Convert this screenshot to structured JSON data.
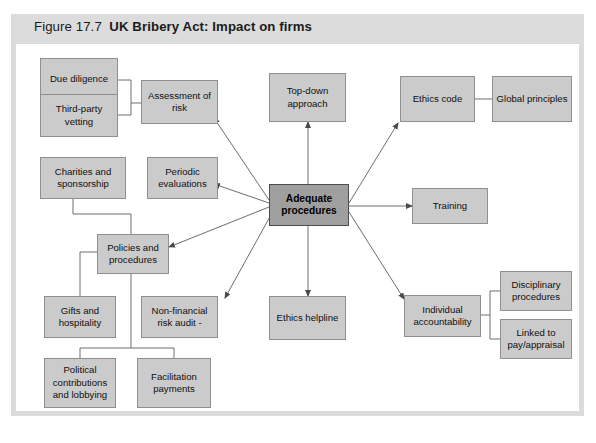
{
  "figure": {
    "number": "Figure 17.7",
    "title": "UK Bribery Act: Impact on firms",
    "full_title": "Figure 17.7  UK Bribery Act: Impact on firms"
  },
  "colors": {
    "frame": "#dcdcdc",
    "node_fill": "#cbcbcb",
    "node_border": "#8f8f8f",
    "center_fill": "#9f9f9f",
    "center_border": "#4d4d4d",
    "connector": "#6e6e6e",
    "page_background": "#ffffff"
  },
  "nodes": {
    "center": {
      "label": "Adequate procedures"
    },
    "due_diligence": {
      "label": "Due diligence"
    },
    "third_party_vetting": {
      "label": "Third-party vetting"
    },
    "assessment_of_risk": {
      "label": "Assessment of risk"
    },
    "charities_and_sponsorship": {
      "label": "Charities and sponsorship"
    },
    "periodic_evaluations": {
      "label": "Periodic evaluations"
    },
    "policies_and_procedures": {
      "label": "Policies and procedures"
    },
    "gifts_and_hospitality": {
      "label": "Gifts and hospitality"
    },
    "non_financial_risk_audit": {
      "label": "Non-financial risk audit  -"
    },
    "political_contributions": {
      "label": "Political contributions and lobbying"
    },
    "facilitation_payments": {
      "label": "Facilitation payments"
    },
    "top_down_approach": {
      "label": "Top-down approach"
    },
    "ethics_helpline": {
      "label": "Ethics helpline"
    },
    "ethics_code": {
      "label": "Ethics code"
    },
    "global_principles": {
      "label": "Global principles"
    },
    "training": {
      "label": "Training"
    },
    "individual_accountability": {
      "label": "Individual accountability"
    },
    "disciplinary_procedures": {
      "label": "Disciplinary procedures"
    },
    "linked_to_pay_appraisal": {
      "label": "Linked to pay/appraisal"
    }
  },
  "diagram_structure": {
    "type": "radial-hierarchy",
    "hub": "Adequate procedures",
    "arrows_from_hub_to": [
      "Assessment of risk",
      "Periodic evaluations",
      "Policies and procedures",
      "Non-financial risk audit",
      "Top-down approach",
      "Ethics helpline",
      "Ethics code",
      "Training",
      "Individual accountability"
    ],
    "plain_links": [
      {
        "from": "Due diligence",
        "to": "Assessment of risk"
      },
      {
        "from": "Third-party vetting",
        "to": "Assessment of risk"
      },
      {
        "from": "Charities and sponsorship",
        "to": "Policies and procedures"
      },
      {
        "from": "Policies and procedures",
        "to": "Gifts and hospitality"
      },
      {
        "from": "Policies and procedures",
        "to": "Political contributions and lobbying"
      },
      {
        "from": "Policies and procedures",
        "to": "Facilitation payments"
      },
      {
        "from": "Ethics code",
        "to": "Global principles"
      },
      {
        "from": "Individual accountability",
        "to": "Disciplinary procedures"
      },
      {
        "from": "Individual accountability",
        "to": "Linked to pay/appraisal"
      }
    ]
  }
}
